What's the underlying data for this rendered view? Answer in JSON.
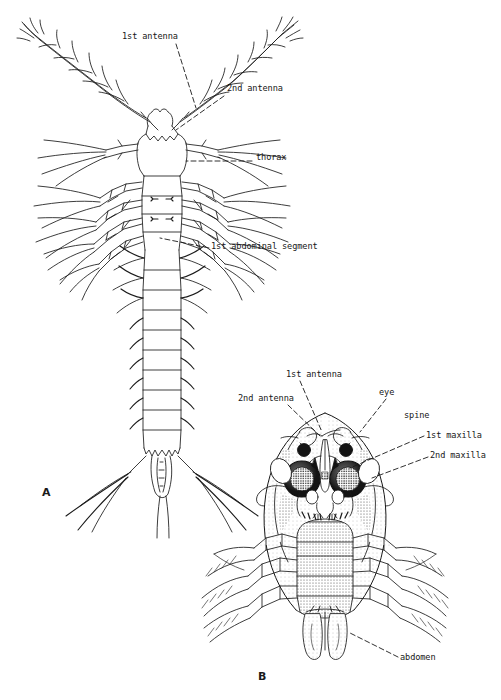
{
  "figure": {
    "background_color": "#ffffff",
    "ink_color": "#1a1a1a",
    "caption_font_note": "monospace typewriter style",
    "panels": [
      {
        "id": "A",
        "letter": "A",
        "view": "dorsal whole-body larva",
        "x": 42,
        "y": 494
      },
      {
        "id": "B",
        "letter": "B",
        "view": "ventral cephalothorax detail",
        "x": 258,
        "y": 678
      }
    ],
    "labels_panel_a": [
      {
        "text": "1st antenna",
        "x": 122,
        "y": 38,
        "anchor": "start"
      },
      {
        "text": "2nd antenna",
        "x": 227,
        "y": 90,
        "anchor": "start"
      },
      {
        "text": "thorax",
        "x": 256,
        "y": 159,
        "anchor": "start"
      },
      {
        "text": "1st abdominal segment",
        "x": 211,
        "y": 248,
        "anchor": "start"
      }
    ],
    "labels_panel_b": [
      {
        "text": "1st antenna",
        "x": 286,
        "y": 376,
        "anchor": "start"
      },
      {
        "text": "2nd antenna",
        "x": 238,
        "y": 400,
        "anchor": "start"
      },
      {
        "text": "eye",
        "x": 379,
        "y": 394,
        "anchor": "start"
      },
      {
        "text": "spine",
        "x": 404,
        "y": 417,
        "anchor": "start"
      },
      {
        "text": "1st maxilla",
        "x": 426,
        "y": 437,
        "anchor": "start"
      },
      {
        "text": "2nd maxilla",
        "x": 430,
        "y": 457,
        "anchor": "start"
      },
      {
        "text": "abdomen",
        "x": 400,
        "y": 659,
        "anchor": "start"
      }
    ],
    "leaders_panel_a": [
      {
        "for": "1st antenna",
        "x1": 176,
        "y1": 44,
        "x2": 196,
        "y2": 108
      },
      {
        "for": "2nd antenna",
        "x1": 224,
        "y1": 96,
        "x2": 176,
        "y2": 130
      },
      {
        "for": "thorax",
        "x1": 252,
        "y1": 161,
        "x2": 186,
        "y2": 161
      },
      {
        "for": "1st abdominal segment",
        "x1": 209,
        "y1": 248,
        "x2": 160,
        "y2": 238
      }
    ],
    "leaders_panel_b": [
      {
        "for": "1st antenna",
        "x1": 300,
        "y1": 381,
        "x2": 322,
        "y2": 432
      },
      {
        "for": "2nd antenna",
        "x1": 288,
        "y1": 405,
        "x2": 320,
        "y2": 436
      },
      {
        "for": "eye",
        "x1": 386,
        "y1": 399,
        "x2": 360,
        "y2": 432
      },
      {
        "for": "1st maxilla",
        "x1": 424,
        "y1": 436,
        "x2": 350,
        "y2": 468
      },
      {
        "for": "2nd maxilla",
        "x1": 428,
        "y1": 457,
        "x2": 372,
        "y2": 478
      },
      {
        "for": "abdomen",
        "x1": 398,
        "y1": 657,
        "x2": 348,
        "y2": 632
      }
    ]
  }
}
